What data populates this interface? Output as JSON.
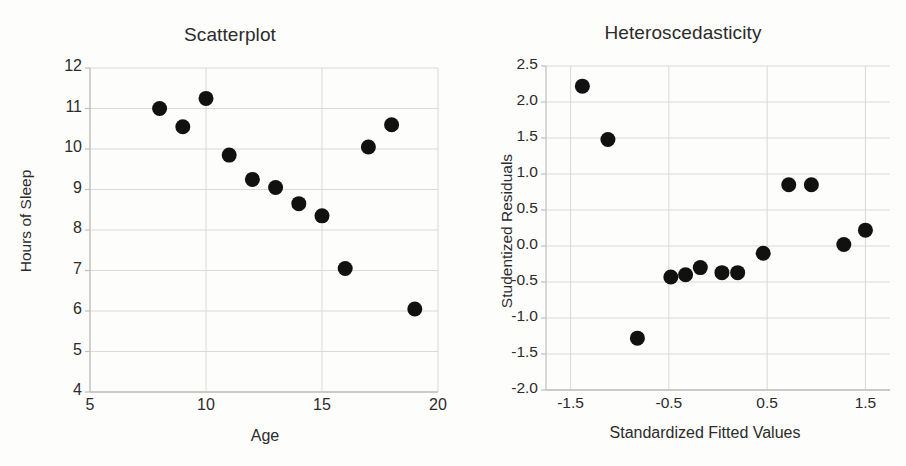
{
  "figure": {
    "background_color": "#fdfdfc",
    "marker_color": "#111111",
    "gridline_color": "#d9d9d9",
    "axis_color": "#bfbfbf",
    "text_color": "#2b2b2b"
  },
  "chart_data": [
    {
      "type": "scatter",
      "panel": "left",
      "title": "Scatterplot",
      "xlabel": "Age",
      "ylabel": "Hours of Sleep",
      "xlim": [
        5,
        20
      ],
      "ylim": [
        4,
        12
      ],
      "xticks": [
        "5",
        "10",
        "15",
        "20"
      ],
      "xtick_values": [
        5,
        10,
        15,
        20
      ],
      "yticks": [
        "4",
        "5",
        "6",
        "7",
        "8",
        "9",
        "10",
        "11",
        "12"
      ],
      "ytick_values": [
        4,
        5,
        6,
        7,
        8,
        9,
        10,
        11,
        12
      ],
      "grid": true,
      "legend": false,
      "x": [
        8,
        9,
        10,
        11,
        12,
        13,
        14,
        15,
        16,
        17,
        18,
        19
      ],
      "y": [
        11.0,
        10.55,
        11.25,
        9.85,
        9.25,
        9.05,
        8.65,
        8.35,
        7.05,
        10.05,
        10.6,
        6.05
      ]
    },
    {
      "type": "scatter",
      "panel": "right",
      "title": "Heteroscedasticity",
      "xlabel": "Standardized Fitted Values",
      "ylabel": "Studentized Residuals",
      "xlim": [
        -1.75,
        1.75
      ],
      "ylim": [
        -2.0,
        2.5
      ],
      "xticks": [
        "-1.5",
        "-0.5",
        "0.5",
        "1.5"
      ],
      "xtick_values": [
        -1.5,
        -0.5,
        0.5,
        1.5
      ],
      "yticks": [
        "-2.0",
        "-1.5",
        "-1.0",
        "-0.5",
        "0.0",
        "0.5",
        "1.0",
        "1.5",
        "2.0",
        "2.5"
      ],
      "ytick_values": [
        -2.0,
        -1.5,
        -1.0,
        -0.5,
        0.0,
        0.5,
        1.0,
        1.5,
        2.0,
        2.5
      ],
      "grid": true,
      "legend": false,
      "x": [
        -1.38,
        -1.12,
        -0.82,
        -0.48,
        -0.33,
        -0.18,
        0.04,
        0.2,
        0.46,
        0.72,
        0.95,
        1.28,
        1.5
      ],
      "y": [
        2.22,
        1.48,
        -1.28,
        -0.43,
        -0.4,
        -0.3,
        -0.37,
        -0.37,
        -0.1,
        0.85,
        0.85,
        0.02,
        0.22
      ]
    }
  ]
}
